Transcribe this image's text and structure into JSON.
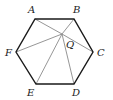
{
  "diagram": {
    "colors": {
      "hexagon_edge": "#1a1a1a",
      "segment": "#8a8a8a",
      "label": "#222222",
      "background": "#ffffff"
    },
    "vertices": [
      {
        "name": "A",
        "x": 35,
        "y": 19,
        "label_x": 28,
        "label_y": 13
      },
      {
        "name": "B",
        "x": 74,
        "y": 19,
        "label_x": 73,
        "label_y": 13
      },
      {
        "name": "C",
        "x": 93,
        "y": 52,
        "label_x": 97,
        "label_y": 56
      },
      {
        "name": "D",
        "x": 74,
        "y": 84,
        "label_x": 72,
        "label_y": 96
      },
      {
        "name": "E",
        "x": 36,
        "y": 84,
        "label_x": 27,
        "label_y": 96
      },
      {
        "name": "F",
        "x": 16,
        "y": 52,
        "label_x": 5,
        "label_y": 56
      }
    ],
    "point_q": {
      "name": "Q",
      "x": 62,
      "y": 34,
      "label_x": 66,
      "label_y": 48
    },
    "segments_from_q": [
      "A",
      "B",
      "C",
      "D",
      "E",
      "F"
    ]
  }
}
